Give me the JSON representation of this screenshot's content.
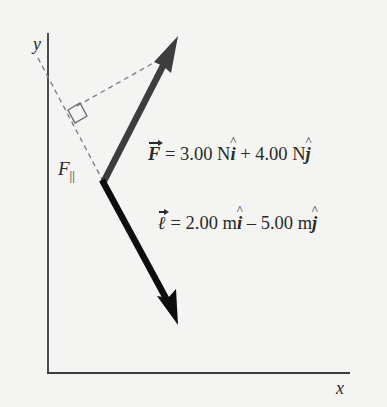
{
  "figure": {
    "axes": {
      "x_label": "x",
      "y_label": "y"
    },
    "vectors": [
      {
        "name": "F",
        "equation": {
          "symbol": "F",
          "equals": " = ",
          "x_component": "3.00 N",
          "unit_x": "i",
          "operator": " + ",
          "y_component": "4.00 N",
          "unit_y": "j"
        },
        "components": [
          3.0,
          4.0
        ],
        "unit": "N",
        "color": "#3d3d3d"
      },
      {
        "name": "ell",
        "equation": {
          "symbol": "ℓ",
          "equals": " = ",
          "x_component": "2.00 m",
          "unit_x": "i",
          "operator": " – ",
          "y_component": "5.00 m",
          "unit_y": "j"
        },
        "components": [
          2.0,
          -5.0
        ],
        "unit": "m",
        "color": "#0d0d0d"
      }
    ],
    "projection_label": {
      "symbol": "F",
      "subscript": "||"
    },
    "colors": {
      "background": "#f4f4f2",
      "axes": "#3a3a3a",
      "dashed": "#7a7a7a",
      "text": "#2a2a2a"
    }
  }
}
